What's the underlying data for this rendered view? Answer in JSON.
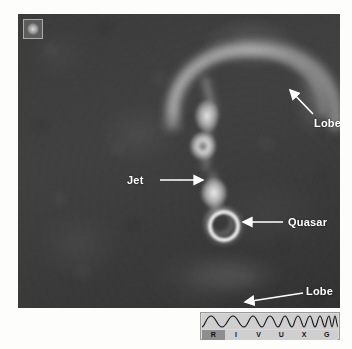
{
  "figure": {
    "alt_description": "Radio image of a quasar showing a jet and two lobes",
    "corner_icon": "source-thumbnail-icon"
  },
  "annotations": [
    {
      "id": "lobe-upper",
      "label": "Lobe",
      "arrow": "up-left"
    },
    {
      "id": "jet",
      "label": "Jet",
      "arrow": "right"
    },
    {
      "id": "quasar",
      "label": "Quasar",
      "arrow": "left"
    },
    {
      "id": "lobe-lower",
      "label": "Lobe",
      "arrow": "down-left"
    }
  ],
  "spectrum": {
    "name": "electromagnetic-spectrum-indicator",
    "active_band": "R",
    "bands": [
      {
        "code": "R",
        "name": "Radio"
      },
      {
        "code": "I",
        "name": "Infrared"
      },
      {
        "code": "V",
        "name": "Visible"
      },
      {
        "code": "U",
        "name": "Ultraviolet"
      },
      {
        "code": "X",
        "name": "X-ray"
      },
      {
        "code": "G",
        "name": "Gamma ray"
      }
    ]
  },
  "colors": {
    "image_background": "#3d3d3d",
    "annotation_text": "#ffffff",
    "spectrum_background": "#d9d9d9",
    "spectrum_active": "#8e8e8e"
  }
}
